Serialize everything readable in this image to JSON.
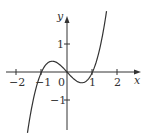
{
  "chart_data": {
    "type": "line",
    "title": "",
    "function": "y = x^3 - x",
    "xlabel": "x",
    "ylabel": "y",
    "xlim": [
      -2.6,
      2.9
    ],
    "ylim": [
      -2.3,
      2.7
    ],
    "x_ticks": [
      "-2",
      "-1",
      "0",
      "1",
      "2"
    ],
    "y_ticks": [
      "1",
      "-1"
    ],
    "origin_label": "0",
    "series": [
      {
        "name": "curve",
        "x": [
          -1.55,
          -1.4,
          -1.2,
          -1.0,
          -0.8,
          -0.577,
          -0.3,
          0.0,
          0.3,
          0.577,
          0.8,
          1.0,
          1.2,
          1.4,
          1.55
        ],
        "y": [
          -2.17,
          -1.34,
          -0.53,
          0.0,
          0.29,
          0.385,
          0.27,
          0.0,
          -0.27,
          -0.385,
          -0.29,
          0.0,
          0.53,
          1.34,
          2.17
        ]
      }
    ],
    "grid": false,
    "legend": null,
    "color": "#333333"
  },
  "labels": {
    "x_axis": "x",
    "y_axis": "y",
    "tick_neg2": "−2",
    "tick_neg1": "−1",
    "tick_0": "0",
    "tick_1": "1",
    "tick_2": "2",
    "ytick_1": "1",
    "ytick_neg1": "−1"
  }
}
